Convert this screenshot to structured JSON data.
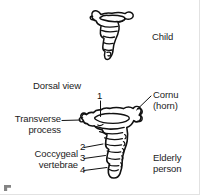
{
  "figure": {
    "background_color": "#ffffff",
    "line_color": "#111111",
    "text_color": "#1c1c1c"
  },
  "labels": {
    "child": "Child",
    "dorsal_view": "Dorsal view",
    "cornu_line1": "Cornu",
    "cornu_line2": "(horn)",
    "transverse_line1": "Transverse",
    "transverse_line2": "process",
    "coccygeal_line1": "Coccygeal",
    "coccygeal_line2": "vertebrae",
    "elderly_line1": "Elderly",
    "elderly_line2": "person"
  },
  "callouts": [
    {
      "number": "1",
      "target": "first coccygeal vertebra"
    },
    {
      "number": "2",
      "target": "second coccygeal vertebra"
    },
    {
      "number": "3",
      "target": "third coccygeal vertebra"
    },
    {
      "number": "4",
      "target": "fourth coccygeal vertebra"
    }
  ],
  "specimens": [
    {
      "name": "child-coccyx",
      "caption": "Child",
      "view": "dorsal"
    },
    {
      "name": "elderly-coccyx",
      "caption": "Elderly person",
      "view": "Dorsal view"
    }
  ]
}
